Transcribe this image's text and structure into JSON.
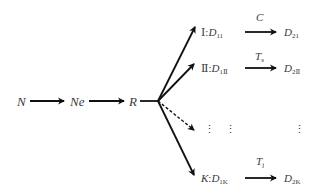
{
  "diagram": {
    "type": "flow",
    "main_chain": [
      {
        "id": "N",
        "label": "N"
      },
      {
        "id": "Ne",
        "label": "Ne"
      },
      {
        "id": "R",
        "label": "R"
      }
    ],
    "branches": [
      {
        "class": "Ⅰ",
        "sep": ":",
        "source": "D",
        "source_sub": "11",
        "transform": "C",
        "transform_sub": "",
        "target": "D",
        "target_sub": "21",
        "line_style": "solid"
      },
      {
        "class": "Ⅱ",
        "sep": ":",
        "source": "D",
        "source_sub": "1Ⅱ",
        "transform": "T",
        "transform_sub": "s",
        "target": "D",
        "target_sub": "2Ⅱ",
        "line_style": "solid"
      },
      {
        "class": "⋮",
        "sep": "",
        "source": "⋮",
        "source_sub": "",
        "transform": "",
        "transform_sub": "",
        "target": "⋮",
        "target_sub": "",
        "line_style": "dashed"
      },
      {
        "class": "K",
        "sep": ":",
        "source": "D",
        "source_sub": "1K",
        "transform": "T",
        "transform_sub": "j",
        "target": "D",
        "target_sub": "2K",
        "line_style": "solid"
      }
    ],
    "colors": {
      "line": "#111111",
      "text": "#3a3a3a",
      "background": "#ffffff"
    }
  }
}
